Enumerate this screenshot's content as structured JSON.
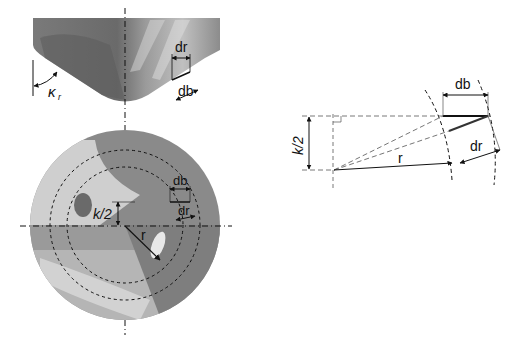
{
  "tool_tip_view": {
    "labels": {
      "kappa_r": "κ",
      "kappa_r_sub": "r",
      "dr": "dr",
      "db": "db"
    }
  },
  "face_view": {
    "labels": {
      "k_half": "k/2",
      "r": "r",
      "db": "db",
      "dr": "dr"
    }
  },
  "geometry_view": {
    "labels": {
      "k_half": "k/2",
      "r": "r",
      "db": "db",
      "dr": "dr"
    }
  },
  "colors": {
    "tool_dark": "#6e6e6e",
    "tool_mid": "#8a8a8a",
    "tool_light": "#c8c8c8",
    "line": "#111111"
  }
}
